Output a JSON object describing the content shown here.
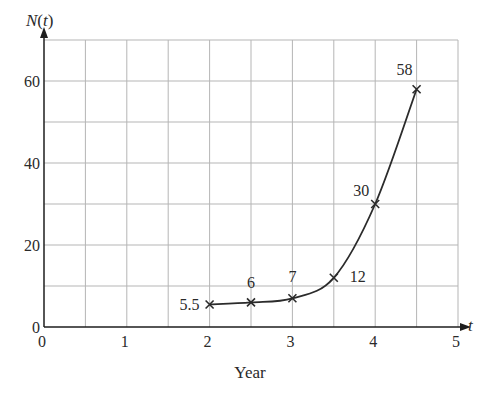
{
  "chart_data": {
    "type": "line",
    "title": "",
    "xlabel": "Year",
    "ylabel": "N(t)",
    "x_axis_symbol": "t",
    "xlim": [
      0,
      5
    ],
    "ylim": [
      0,
      70
    ],
    "x_ticks": [
      0,
      1,
      2,
      3,
      4,
      5
    ],
    "x_tick_labels": [
      "0",
      "1",
      "2",
      "3",
      "4",
      "5"
    ],
    "y_ticks": [
      0,
      20,
      40,
      60
    ],
    "y_tick_labels": [
      "0",
      "20",
      "40",
      "60"
    ],
    "grid": true,
    "grid_x_step": 0.5,
    "grid_y_step": 10,
    "legend": null,
    "marker": "x",
    "series": [
      {
        "name": "N(t)",
        "x": [
          2,
          2.5,
          3,
          3.5,
          4,
          4.5
        ],
        "values": [
          5.5,
          6,
          7,
          12,
          30,
          58
        ],
        "point_labels": [
          "5.5",
          "6",
          "7",
          "12",
          "30",
          "58"
        ]
      }
    ]
  },
  "colors": {
    "line": "#2b2b2b",
    "grid": "#b5b5b5",
    "axis": "#1e1e1e",
    "text": "#2a2a2a"
  }
}
